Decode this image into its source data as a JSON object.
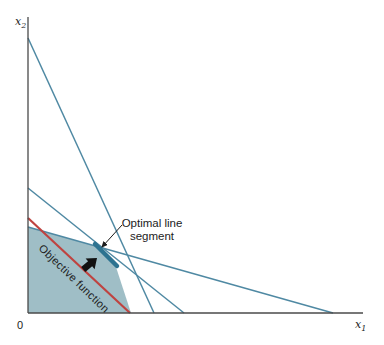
{
  "figure": {
    "colors": {
      "background": "#ffffff",
      "axis": "#4a4a4a",
      "constraint_line": "#4f89a3",
      "region_fill": "#9abac3",
      "optimal_segment": "#2d7390",
      "objective_line": "#bf4340",
      "annotation": "#1c1c1c"
    }
  },
  "labels": {
    "origin": "0",
    "x_axis_main": "x",
    "x_axis_sub": "1",
    "y_axis_main": "x",
    "y_axis_sub": "2",
    "optimal_segment_line1": "Optimal line",
    "optimal_segment_line2": "segment",
    "objective_function": "Objective function"
  },
  "chart_data": {
    "type": "line",
    "title": "",
    "xlabel": "x1",
    "ylabel": "x2",
    "axis_numeric_labels_shown": false,
    "axes_px": {
      "origin": [
        28,
        313
      ],
      "x_end": [
        363,
        313
      ],
      "y_end": [
        28,
        17
      ]
    },
    "constraint_lines_px": [
      {
        "name": "steep-constraint",
        "from": [
          28,
          38
        ],
        "to": [
          154,
          313
        ]
      },
      {
        "name": "middle-constraint",
        "from": [
          28,
          188
        ],
        "to": [
          184,
          313
        ]
      },
      {
        "name": "shallow-constraint",
        "from": [
          28,
          227
        ],
        "to": [
          333,
          313
        ]
      }
    ],
    "objective_line_px": {
      "name": "objective-function-line",
      "from": [
        28,
        218
      ],
      "to": [
        130,
        313
      ]
    },
    "feasible_region_px": [
      [
        28,
        313
      ],
      [
        28,
        227
      ],
      [
        97,
        246.5
      ],
      [
        115,
        264
      ],
      [
        131,
        313
      ]
    ],
    "optimal_segment_px": {
      "from": [
        95,
        244
      ],
      "to": [
        117,
        266
      ]
    },
    "annotations_px": {
      "pointer_line": {
        "from": [
          122,
          225
        ],
        "to": [
          102,
          247
        ]
      },
      "direction_arrow": {
        "tip": [
          97,
          258
        ],
        "angle_deg": -40
      }
    }
  }
}
